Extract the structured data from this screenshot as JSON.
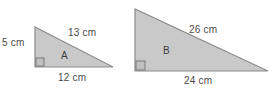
{
  "figure": {
    "background_color": "#ffffff",
    "fill_color": "#c9c9c9",
    "stroke_color": "#8a8a8a",
    "text_color": "#4a4a4a",
    "units": "cm"
  },
  "triangles": [
    {
      "name": "A",
      "label": "A",
      "right_angle": "bottom-left",
      "sides": {
        "vertical_leg": "5 cm",
        "horizontal_leg": "12 cm",
        "hypotenuse": "13 cm"
      },
      "values": {
        "vertical_leg": 5,
        "horizontal_leg": 12,
        "hypotenuse": 13
      },
      "geometry": {
        "apex": [
          35,
          27
        ],
        "right_angle_vertex": [
          35,
          67
        ],
        "far_vertex": [
          113,
          67
        ]
      }
    },
    {
      "name": "B",
      "label": "B",
      "right_angle": "bottom-left",
      "sides": {
        "vertical_leg": "",
        "horizontal_leg": "24 cm",
        "hypotenuse": "26 cm"
      },
      "values": {
        "horizontal_leg": 24,
        "hypotenuse": 26
      },
      "geometry": {
        "apex": [
          135,
          9
        ],
        "right_angle_vertex": [
          135,
          71
        ],
        "far_vertex": [
          268,
          71
        ]
      }
    }
  ],
  "labels": {
    "a_vertical": "5 cm",
    "a_hypotenuse": "13 cm",
    "a_horizontal": "12 cm",
    "a_name": "A",
    "b_hypotenuse": "26 cm",
    "b_horizontal": "24 cm",
    "b_name": "B"
  }
}
